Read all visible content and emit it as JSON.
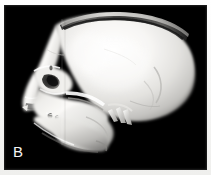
{
  "figure": {
    "panel_label": "B",
    "modality": "3D CT volume rendering",
    "view": "lateral oblique skull",
    "background_color": "#000000",
    "border_color": "#ffffff",
    "bone_color": "#f6f5f3",
    "bone_shadow_color": "#8d8c8a",
    "label_color": "#f4f4f4"
  },
  "anatomy": {
    "regions": [
      {
        "name": "calvarium",
        "label": "cranial vault"
      },
      {
        "name": "calvarial-cut-rim",
        "label": "craniotomy cut rim"
      },
      {
        "name": "frontal-bone",
        "label": "frontal bone"
      },
      {
        "name": "orbit",
        "label": "orbital rim"
      },
      {
        "name": "nasal-aperture",
        "label": "nasal aperture"
      },
      {
        "name": "maxilla",
        "label": "maxilla"
      },
      {
        "name": "mandible",
        "label": "mandible"
      },
      {
        "name": "dentition",
        "label": "dentition"
      },
      {
        "name": "zygomatic-arch",
        "label": "zygomatic arch"
      },
      {
        "name": "styloid-spikes",
        "label": "styloid / pterygoid spicules"
      },
      {
        "name": "occiput",
        "label": "occipital region"
      }
    ]
  }
}
